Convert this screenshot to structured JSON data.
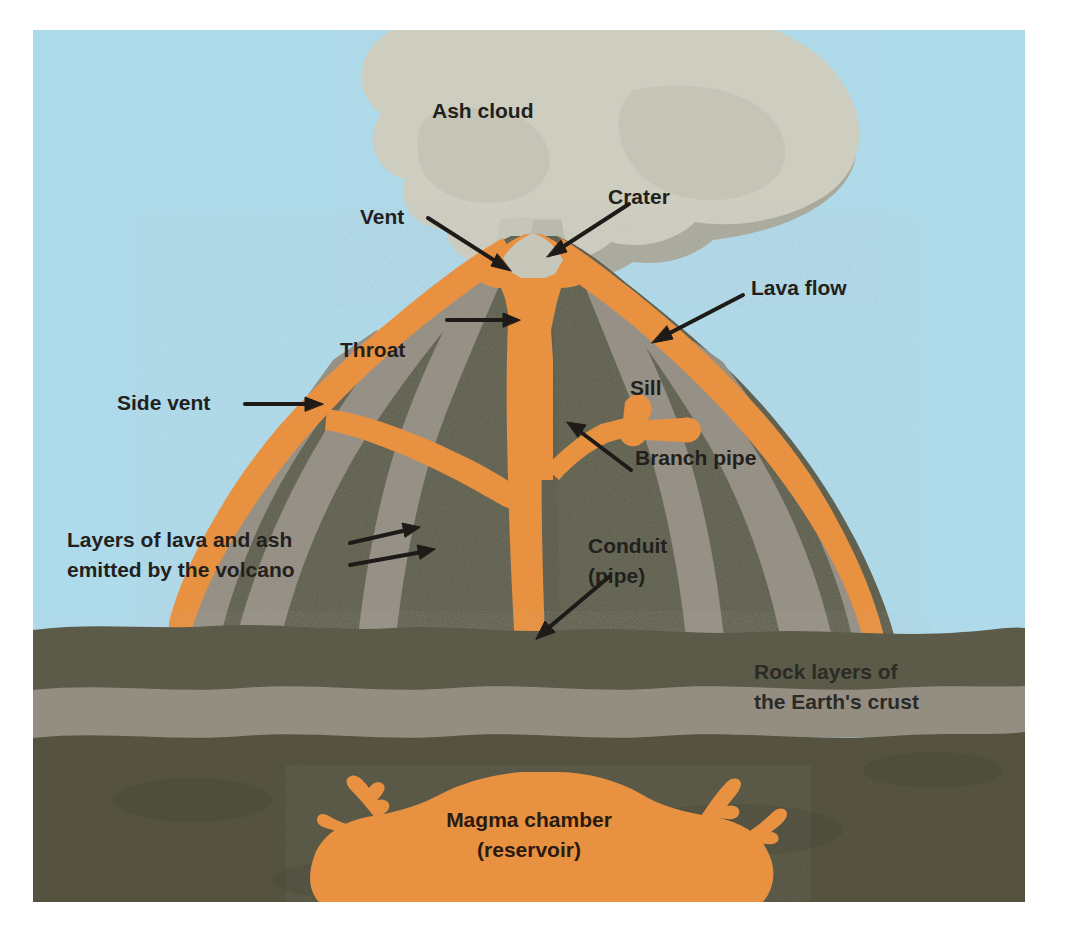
{
  "figure": {
    "type": "cutaway-illustration"
  },
  "palette": {
    "sky": "#aedbec",
    "ash_cloud_light": "#cdcdc0",
    "ash_cloud_mid": "#bdbdae",
    "ash_cloud_dark": "#a8a89a",
    "cone_dark_layer": "#5d5d4b",
    "cone_light_layer": "#948e83",
    "lava_orange": "#e8913f",
    "lava_orange_light": "#f0a45a",
    "ground_top_soil": "#5b5a48",
    "ground_pale_band": "#948e82",
    "ground_deep": "#55523f",
    "label_text": "#231f1c",
    "page_background": "#ffffff"
  },
  "labels": {
    "ash_cloud": "Ash cloud",
    "crater": "Crater",
    "vent": "Vent",
    "lava_flow": "Lava flow",
    "throat": "Throat",
    "sill": "Sill",
    "side_vent": "Side vent",
    "branch_pipe": "Branch pipe",
    "layers_line1": "Layers of lava and ash",
    "layers_line2": "emitted by the volcano",
    "conduit_line1": "Conduit",
    "conduit_line2": "(pipe)",
    "rock_layers_line1": "Rock layers of",
    "rock_layers_line2": "the Earth's crust",
    "magma_line1": "Magma chamber",
    "magma_line2": "(reservoir)"
  },
  "parts": [
    {
      "id": "ash-cloud",
      "name": "Ash cloud",
      "description": "Billowing grey plume rising from the crater"
    },
    {
      "id": "crater",
      "name": "Crater",
      "description": "Bowl-shaped opening at the summit"
    },
    {
      "id": "vent",
      "name": "Vent",
      "description": "Opening at the top of the throat"
    },
    {
      "id": "lava-flow",
      "name": "Lava flow",
      "description": "Orange lava running down the outer flanks"
    },
    {
      "id": "throat",
      "name": "Throat",
      "description": "Upper part of the conduit below the vent"
    },
    {
      "id": "sill",
      "name": "Sill",
      "description": "Horizontal intrusion of magma between layers"
    },
    {
      "id": "side-vent",
      "name": "Side vent",
      "description": "Secondary opening on the flank of the cone"
    },
    {
      "id": "branch-pipe",
      "name": "Branch pipe",
      "description": "Offshoot channel feeding the sill"
    },
    {
      "id": "layers",
      "name": "Layers of lava and ash emitted by the volcano",
      "description": "Alternating dark and light strata forming the cone"
    },
    {
      "id": "conduit",
      "name": "Conduit (pipe)",
      "description": "Main vertical channel from chamber to vent"
    },
    {
      "id": "rock-layers",
      "name": "Rock layers of the Earth's crust",
      "description": "Stratified bedrock beneath the surface"
    },
    {
      "id": "magma-chamber",
      "name": "Magma chamber (reservoir)",
      "description": "Large reservoir of molten rock at depth"
    }
  ]
}
